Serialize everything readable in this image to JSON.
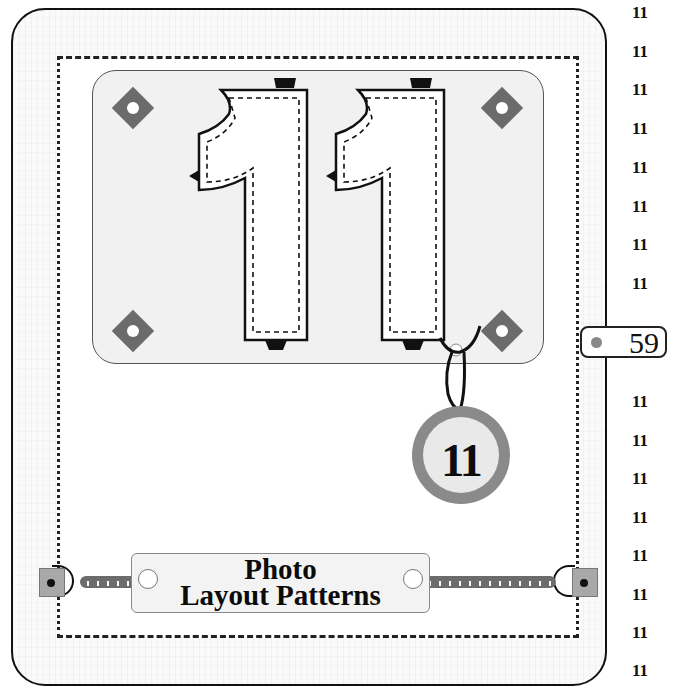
{
  "page": {
    "background_color": "#fafafa",
    "border_color": "#111111",
    "accent_gray": "#6b6b6b"
  },
  "photo_panel": {
    "numeral": "11",
    "corner_ornaments": [
      "diamond-top-left",
      "diamond-top-right",
      "diamond-bottom-left",
      "diamond-bottom-right"
    ]
  },
  "tag_medal": {
    "label": "11",
    "ring_color": "#8a8a8a",
    "fill_color": "#e9e9e9"
  },
  "title_plate": {
    "line1": "Photo",
    "line2": "Layout Patterns"
  },
  "page_tab": {
    "page_number": "59",
    "dot_color": "#888888"
  },
  "side_index": {
    "items": [
      "11",
      "11",
      "11",
      "11",
      "11",
      "11",
      "11",
      "11",
      "11",
      "11",
      "11",
      "11",
      "11",
      "11",
      "11",
      "11"
    ]
  }
}
